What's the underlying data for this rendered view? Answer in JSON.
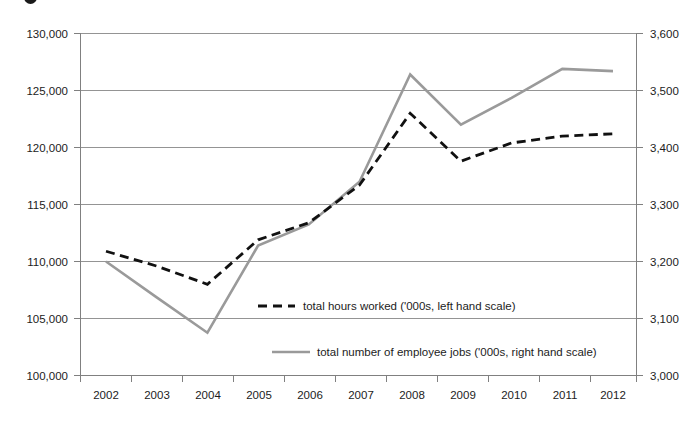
{
  "chart_data": {
    "type": "line",
    "title": "",
    "subtitle": "",
    "xlabel": "",
    "ylabel": "",
    "grid": true,
    "legend_position": "inside-center",
    "categories": [
      "2002",
      "2003",
      "2004",
      "2005",
      "2006",
      "2007",
      "2008",
      "2009",
      "2010",
      "2011",
      "2012"
    ],
    "axes": {
      "left": {
        "label": "total hours worked ('000s)",
        "min": 100000,
        "max": 130000,
        "step": 5000,
        "ticks": [
          "100,000",
          "105,000",
          "110,000",
          "115,000",
          "120,000",
          "125,000",
          "130,000"
        ]
      },
      "right": {
        "label": "total number of employee jobs ('000s)",
        "min": 3000,
        "max": 3600,
        "step": 100,
        "ticks": [
          "3,000",
          "3,100",
          "3,200",
          "3,300",
          "3,400",
          "3,500",
          "3,600"
        ]
      }
    },
    "series": [
      {
        "name": "total hours worked ('000s, left hand scale)",
        "axis": "left",
        "style": "dashed",
        "color": "#111111",
        "values": [
          110900,
          109600,
          108000,
          111900,
          113400,
          116700,
          123000,
          118800,
          120400,
          121000,
          121200
        ]
      },
      {
        "name": "total number of employee jobs ('000s, right hand scale)",
        "axis": "right",
        "style": "solid",
        "color": "#9a9a9a",
        "values": [
          3200,
          3137,
          3075,
          3228,
          3265,
          3340,
          3528,
          3440,
          3487,
          3538,
          3534
        ]
      }
    ],
    "legend": [
      {
        "label": "total hours worked ('000s, left hand scale)",
        "style": "dashed",
        "color": "#111111"
      },
      {
        "label": "total number of employee jobs ('000s, right hand scale)",
        "style": "solid",
        "color": "#9a9a9a"
      }
    ]
  }
}
